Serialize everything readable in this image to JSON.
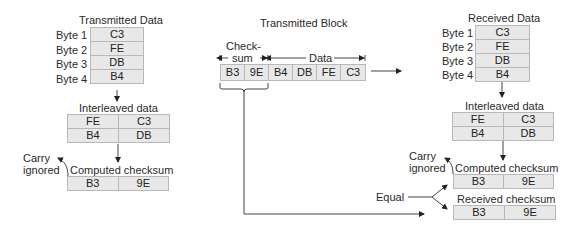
{
  "transmitter": {
    "title": "Transmitted Data",
    "bytes": [
      {
        "label": "Byte 1",
        "value": "C3"
      },
      {
        "label": "Byte 2",
        "value": "FE"
      },
      {
        "label": "Byte 3",
        "value": "DB"
      },
      {
        "label": "Byte 4",
        "value": "B4"
      }
    ],
    "interleaved_title": "Interleaved data",
    "interleaved": [
      [
        "FE",
        "C3"
      ],
      [
        "B4",
        "DB"
      ]
    ],
    "carry_label_1": "Carry",
    "carry_label_2": "ignored",
    "checksum_title": "Computed checksum",
    "checksum": [
      "B3",
      "9E"
    ]
  },
  "block": {
    "title": "Transmitted Block",
    "checksum_label_1": "Check-",
    "checksum_label_2": "sum",
    "data_label": "Data",
    "cells": [
      "B3",
      "9E",
      "B4",
      "DB",
      "FE",
      "C3"
    ]
  },
  "receiver": {
    "title": "Received Data",
    "bytes": [
      {
        "label": "Byte 1",
        "value": "C3"
      },
      {
        "label": "Byte 2",
        "value": "FE"
      },
      {
        "label": "Byte 3",
        "value": "DB"
      },
      {
        "label": "Byte 4",
        "value": "B4"
      }
    ],
    "interleaved_title": "Interleaved data",
    "interleaved": [
      [
        "FE",
        "C3"
      ],
      [
        "B4",
        "DB"
      ]
    ],
    "carry_label_1": "Carry",
    "carry_label_2": "ignored",
    "computed_title": "Computed checksum",
    "computed": [
      "B3",
      "9E"
    ],
    "received_title": "Received checksum",
    "received": [
      "B3",
      "9E"
    ],
    "equal_label": "Equal"
  }
}
